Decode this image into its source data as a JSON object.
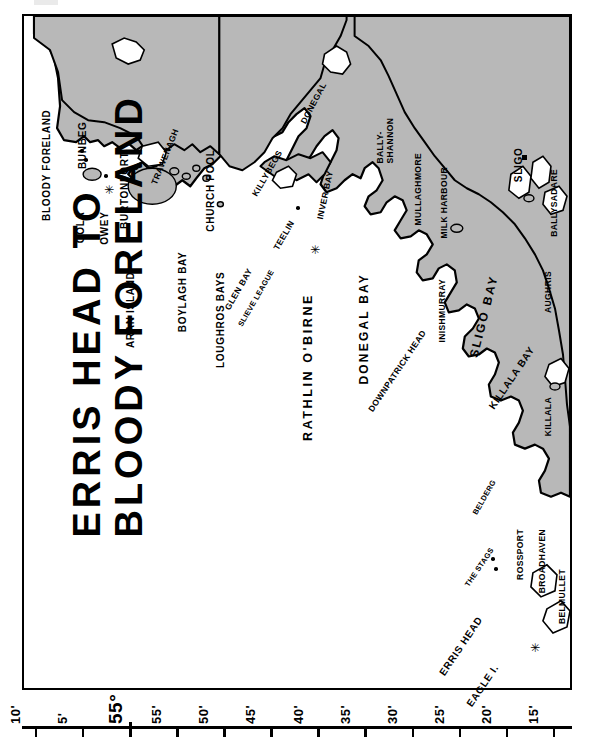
{
  "chart": {
    "title_line1": "ERRIS HEAD TO",
    "title_line2": "BLOODY FORELAND",
    "orientation_note": "chart rotated 90 degrees",
    "land_fill": "#b8b8b8",
    "sea_fill": "#ffffff",
    "outline": "#000000"
  },
  "scale": {
    "name": "latitude-scale",
    "ticks": [
      {
        "label": "10'",
        "major": false
      },
      {
        "label": "5'",
        "major": false
      },
      {
        "label": "55°",
        "major": true
      },
      {
        "label": "55'",
        "major": false
      },
      {
        "label": "50'",
        "major": false
      },
      {
        "label": "45'",
        "major": false
      },
      {
        "label": "40'",
        "major": false
      },
      {
        "label": "35'",
        "major": false
      },
      {
        "label": "30'",
        "major": false
      },
      {
        "label": "25'",
        "major": false
      },
      {
        "label": "20'",
        "major": false
      },
      {
        "label": "15'",
        "major": false
      }
    ]
  },
  "places": [
    {
      "name": "BLOODY FORELAND"
    },
    {
      "name": "GOLA"
    },
    {
      "name": "OWEY"
    },
    {
      "name": "BUNBEG"
    },
    {
      "name": "BURTONPORT"
    },
    {
      "name": "ARAN ISLAND"
    },
    {
      "name": "TRAWENAGH"
    },
    {
      "name": "BOYLAGH BAY"
    },
    {
      "name": "CHURCH POOL"
    },
    {
      "name": "LOUGHROS BAYS"
    },
    {
      "name": "GLEN BAY"
    },
    {
      "name": "SLIEVE LEAGUE"
    },
    {
      "name": "TEELIN"
    },
    {
      "name": "KILLYBEGS"
    },
    {
      "name": "DONEGAL"
    },
    {
      "name": "INVER BAY"
    },
    {
      "name": "DONEGAL BAY"
    },
    {
      "name": "BALLY-"
    },
    {
      "name": "SHANNON"
    },
    {
      "name": "MULLAGHMORE"
    },
    {
      "name": "MILK HARBOUR"
    },
    {
      "name": "SLIGO"
    },
    {
      "name": "BALLYSADARE"
    },
    {
      "name": "AUGHRIS"
    },
    {
      "name": "SLIGO BAY"
    },
    {
      "name": "INISHMURRAY"
    },
    {
      "name": "RATHLIN O'BIRNE"
    },
    {
      "name": "DOWNPATRICK HEAD"
    },
    {
      "name": "KILLALA BAY"
    },
    {
      "name": "KILLALA"
    },
    {
      "name": "BELDERG"
    },
    {
      "name": "ROSSPORT"
    },
    {
      "name": "BROADHAVEN"
    },
    {
      "name": "BELMULLET"
    },
    {
      "name": "THE STAGS"
    },
    {
      "name": "ERRIS HEAD"
    },
    {
      "name": "EAGLE I."
    }
  ],
  "labels": {
    "bloody_foreland": "BLOODY FORELAND",
    "gola": "GOLA",
    "owey": "OWEY",
    "bunbeg": "BUNBEG",
    "burtonport": "BURTONPORT",
    "aran_island": "ARAN ISLAND",
    "trawenagh": "TRAWENAGH",
    "boylagh_bay": "BOYLAGH BAY",
    "church_pool": "CHURCH POOL",
    "loughros_bays": "LOUGHROS BAYS",
    "glen_bay": "GLEN BAY",
    "slieve_league": "SLIEVE LEAGUE",
    "teelin": "TEELIN",
    "killybegs": "KILLYBEGS",
    "donegal": "DONEGAL",
    "inver_bay": "INVER BAY",
    "donegal_bay": "DONEGAL BAY",
    "ballyshannon_1": "BALLY-",
    "ballyshannon_2": "SHANNON",
    "mullaghmore": "MULLAGHMORE",
    "milk_harbour": "MILK HARBOUR",
    "sligo": "SLIGO",
    "ballysadare": "BALLYSADARE",
    "aughris": "AUGHRIS",
    "sligo_bay": "SLIGO  BAY",
    "inishmurray": "INISHMURRAY",
    "rathlin_obirne": "RATHLIN  O'BIRNE",
    "downpatrick_head": "DOWNPATRICK HEAD",
    "killala_bay": "KILLALA BAY",
    "killala": "KILLALA",
    "belderg": "BELDERG",
    "rossport": "ROSSPORT",
    "broadhaven": "BROADHAVEN",
    "belmullet": "BELMULLET",
    "the_stags": "THE STAGS",
    "erris_head": "ERRIS HEAD",
    "eagle_island": "EAGLE I."
  },
  "symbols": {
    "lighthouse_glyph": "✳",
    "town_marker": "square-marker",
    "island_marker": "dot-marker"
  }
}
